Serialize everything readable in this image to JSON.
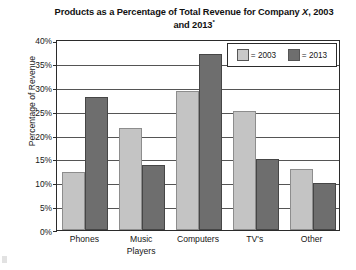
{
  "chart_data": {
    "type": "bar",
    "title": "Products as a Percentage of Total Revenue for Company X, 2003 and 2013*",
    "title_line1": "Products as a Percentage of Total Revenue",
    "title_line2_prefix": "for Company ",
    "title_line2_italic": "X",
    "title_line2_suffix": ", 2003 and 2013",
    "title_footnote_marker": "*",
    "xlabel": "",
    "ylabel": "Percentage of Revenue",
    "ylim": [
      0,
      40
    ],
    "ytick_step": 5,
    "ytick_labels": [
      "0%",
      "5%",
      "10%",
      "15%",
      "20%",
      "25%",
      "30%",
      "35%",
      "40%"
    ],
    "ytick_values": [
      0,
      5,
      10,
      15,
      20,
      25,
      30,
      35,
      40
    ],
    "grid": true,
    "legend_position": "top-right",
    "categories": [
      "Phones",
      "Music Players",
      "Computers",
      "TV's",
      "Other"
    ],
    "category_lines": [
      [
        "Phones"
      ],
      [
        "Music",
        "Players"
      ],
      [
        "Computers"
      ],
      [
        "TV's"
      ],
      [
        "Other"
      ]
    ],
    "series": [
      {
        "name": "2003",
        "legend_label": "= 2003",
        "color": "#c4c4c4",
        "values": [
          12.2,
          21.4,
          29.1,
          25.0,
          12.8
        ]
      },
      {
        "name": "2013",
        "legend_label": "= 2013",
        "color": "#6e6e6e",
        "values": [
          27.8,
          13.7,
          36.9,
          14.9,
          9.8
        ]
      }
    ]
  },
  "colors": {
    "series_2003": "#c4c4c4",
    "series_2013": "#6e6e6e",
    "axis": "#2b2b2b",
    "gridline": "#555555",
    "background": "#ffffff",
    "text": "#161616"
  }
}
